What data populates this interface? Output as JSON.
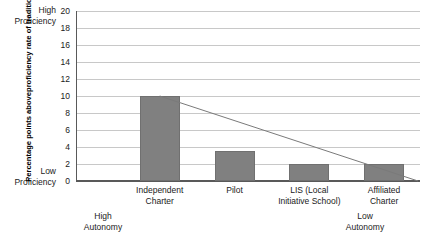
{
  "chart_data": {
    "type": "bar",
    "title": "",
    "subtitle": "",
    "xlabel": "",
    "ylabel": "Percentage points above proficiency rate of traditional public schools",
    "ylim": [
      0,
      20
    ],
    "ytick_step": 2,
    "yticks": [
      20,
      18,
      16,
      14,
      12,
      10,
      8,
      6,
      4,
      2,
      0
    ],
    "grid": true,
    "legend": "none",
    "categories": [
      "Independent Charter",
      "Pilot",
      "LIS (Local Initiative School)",
      "Affiliated Charter"
    ],
    "values": [
      10,
      3.5,
      2,
      2
    ],
    "series": [
      {
        "name": "Percentage points above traditional public schools",
        "values": [
          10,
          3.5,
          2,
          2
        ],
        "type": "bar",
        "color": "#808080"
      },
      {
        "name": "trend",
        "type": "line",
        "color": "#7a7a7a",
        "x": [
          0,
          3.95
        ],
        "values": [
          10,
          0
        ]
      }
    ],
    "annotations": [
      "High Proficiency",
      "Low Proficiency",
      "High Autonomy",
      "Low Autonomy"
    ]
  },
  "axis": {
    "y_title_lines": [
      "Percentage points above",
      "proficiency rate of traditional",
      "public schools"
    ],
    "anchor_high": "High\nProficiency",
    "anchor_high_line1": "High",
    "anchor_high_line2": "Proficiency",
    "anchor_low_line1": "Low",
    "anchor_low_line2": "Proficiency",
    "tick_labels": [
      "20",
      "18",
      "16",
      "14",
      "12",
      "10",
      "8",
      "6",
      "4",
      "2",
      "0"
    ]
  },
  "categories_display": [
    {
      "line1": "Independent",
      "line2": "Charter"
    },
    {
      "line1": "Pilot",
      "line2": ""
    },
    {
      "line1": "LIS (Local",
      "line2": "Initiative School)"
    },
    {
      "line1": "Affiliated",
      "line2": "Charter"
    }
  ],
  "autonomy": {
    "high_line1": "High",
    "high_line2": "Autonomy",
    "low_line1": "Low",
    "low_line2": "Autonomy"
  },
  "colors": {
    "bar_fill": "#808080",
    "bar_stroke": "#707070",
    "gridline": "#c8c8c8",
    "axis": "#595959",
    "trend_line": "#7a7a7a",
    "text": "#1a1a1a"
  }
}
